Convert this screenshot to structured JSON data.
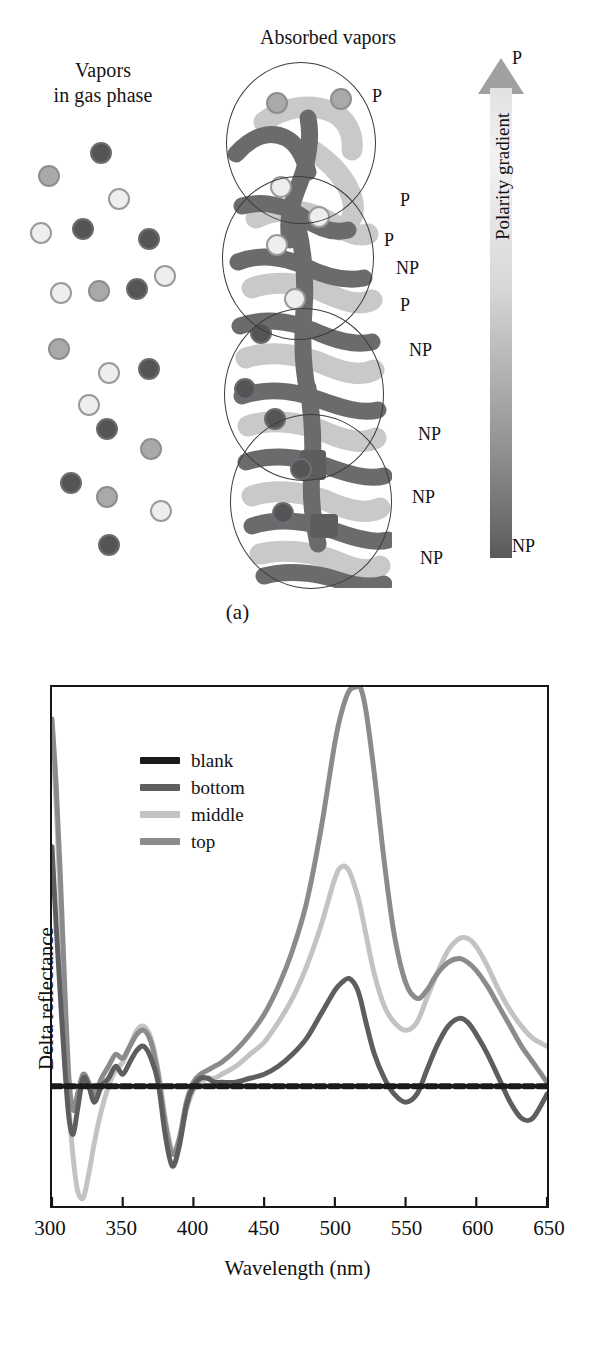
{
  "figure": {
    "panel_a_caption": "(a)",
    "panel_b_caption": "(b)"
  },
  "panel_a": {
    "label_gas_line1": "Vapors",
    "label_gas_line2": "in gas phase",
    "label_absorbed": "Absorbed vapors",
    "gradient": {
      "title": "Polarity gradient",
      "top_label": "P",
      "bottom_label": "NP"
    },
    "polarity_labels": [
      {
        "text": "P",
        "x": 372,
        "y": 86
      },
      {
        "text": "P",
        "x": 400,
        "y": 190
      },
      {
        "text": "P",
        "x": 384,
        "y": 230
      },
      {
        "text": "NP",
        "x": 396,
        "y": 258
      },
      {
        "text": "P",
        "x": 400,
        "y": 295
      },
      {
        "text": "NP",
        "x": 409,
        "y": 340
      },
      {
        "text": "NP",
        "x": 418,
        "y": 424
      },
      {
        "text": "NP",
        "x": 412,
        "y": 487
      },
      {
        "text": "NP",
        "x": 420,
        "y": 548
      }
    ],
    "gas_particles": [
      {
        "x": 60,
        "y": 32,
        "shade": "dark"
      },
      {
        "x": 8,
        "y": 55,
        "shade": "mid"
      },
      {
        "x": 78,
        "y": 78,
        "shade": "light"
      },
      {
        "x": 0,
        "y": 112,
        "shade": "light"
      },
      {
        "x": 42,
        "y": 108,
        "shade": "dark"
      },
      {
        "x": 108,
        "y": 118,
        "shade": "dark"
      },
      {
        "x": 20,
        "y": 172,
        "shade": "light"
      },
      {
        "x": 58,
        "y": 170,
        "shade": "mid"
      },
      {
        "x": 96,
        "y": 168,
        "shade": "dark"
      },
      {
        "x": 124,
        "y": 155,
        "shade": "light"
      },
      {
        "x": 18,
        "y": 228,
        "shade": "mid"
      },
      {
        "x": 68,
        "y": 252,
        "shade": "light"
      },
      {
        "x": 108,
        "y": 248,
        "shade": "dark"
      },
      {
        "x": 48,
        "y": 284,
        "shade": "light"
      },
      {
        "x": 66,
        "y": 308,
        "shade": "dark"
      },
      {
        "x": 110,
        "y": 328,
        "shade": "mid"
      },
      {
        "x": 30,
        "y": 362,
        "shade": "dark"
      },
      {
        "x": 66,
        "y": 376,
        "shade": "mid"
      },
      {
        "x": 120,
        "y": 390,
        "shade": "light"
      },
      {
        "x": 68,
        "y": 424,
        "shade": "dark"
      }
    ],
    "nano_circles": [
      {
        "x": 14,
        "y": 4,
        "size": 150
      },
      {
        "x": 10,
        "y": 118,
        "size": 152
      },
      {
        "x": 12,
        "y": 250,
        "size": 160
      },
      {
        "x": 18,
        "y": 356,
        "size": 162
      }
    ],
    "colors": {
      "particle_dark": "#555558",
      "particle_mid": "#a9a9ab",
      "particle_light": "#eeeeee",
      "nano_dark": "#6b6b6e",
      "nano_light": "#c9c9cb",
      "circle_outline": "#3c3c3c"
    }
  },
  "panel_b": {
    "legend": [
      {
        "label": "blank",
        "color": "#1a1a1a"
      },
      {
        "label": "bottom",
        "color": "#5e5e61"
      },
      {
        "label": "middle",
        "color": "#c3c3c5"
      },
      {
        "label": "top",
        "color": "#8b8b8e"
      }
    ],
    "y_axis_title": "Delta reflectance",
    "x_axis_title": "Wavelength (nm)",
    "x_ticks": [
      "300",
      "350",
      "400",
      "450",
      "500",
      "550",
      "600",
      "650"
    ]
  },
  "chart_data": {
    "type": "line",
    "title": "",
    "xlabel": "Wavelength (nm)",
    "ylabel": "Delta reflectance",
    "xlim": [
      300,
      650
    ],
    "ylim": [
      -0.3,
      1.0
    ],
    "xticks": [
      300,
      350,
      400,
      450,
      500,
      550,
      600,
      650
    ],
    "yticks": [],
    "grid": false,
    "legend_position": "top-left",
    "x": [
      300,
      303,
      306,
      309,
      312,
      315,
      318,
      322,
      326,
      330,
      335,
      340,
      345,
      350,
      355,
      360,
      365,
      370,
      375,
      380,
      385,
      390,
      395,
      400,
      405,
      410,
      415,
      420,
      430,
      440,
      450,
      460,
      470,
      480,
      490,
      500,
      505,
      510,
      515,
      518,
      522,
      528,
      535,
      542,
      550,
      558,
      565,
      572,
      580,
      588,
      594,
      600,
      608,
      616,
      624,
      632,
      640,
      650
    ],
    "series": [
      {
        "name": "blank",
        "color": "#1a1a1a",
        "style": "dashed",
        "values": [
          0,
          0,
          0,
          0,
          0,
          0,
          0,
          0,
          0,
          0,
          0,
          0,
          0,
          0,
          0,
          0,
          0,
          0,
          0,
          0,
          0,
          0,
          0,
          0,
          0,
          0,
          0,
          0,
          0,
          0,
          0,
          0,
          0,
          0,
          0,
          0,
          0,
          0,
          0,
          0,
          0,
          0,
          0,
          0,
          0,
          0,
          0,
          0,
          0,
          0,
          0,
          0,
          0,
          0,
          0,
          0,
          0,
          0
        ]
      },
      {
        "name": "bottom",
        "color": "#5e5e61",
        "style": "solid",
        "values": [
          0.6,
          0.4,
          0.22,
          0.05,
          -0.08,
          -0.12,
          -0.06,
          0.02,
          0.0,
          -0.04,
          0.0,
          0.02,
          0.05,
          0.03,
          0.06,
          0.09,
          0.1,
          0.07,
          0.01,
          -0.12,
          -0.2,
          -0.15,
          -0.05,
          0.0,
          0.02,
          0.02,
          0.01,
          0.01,
          0.01,
          0.02,
          0.03,
          0.05,
          0.08,
          0.12,
          0.18,
          0.24,
          0.26,
          0.27,
          0.25,
          0.22,
          0.16,
          0.08,
          0.02,
          -0.02,
          -0.04,
          -0.02,
          0.04,
          0.1,
          0.15,
          0.17,
          0.16,
          0.13,
          0.08,
          0.02,
          -0.04,
          -0.08,
          -0.08,
          -0.02
        ]
      },
      {
        "name": "middle",
        "color": "#c3c3c5",
        "style": "solid",
        "values": [
          0.88,
          0.7,
          0.45,
          0.18,
          -0.05,
          -0.18,
          -0.26,
          -0.28,
          -0.22,
          -0.14,
          -0.06,
          0.0,
          0.04,
          0.06,
          0.1,
          0.14,
          0.15,
          0.12,
          0.04,
          -0.08,
          -0.16,
          -0.14,
          -0.06,
          -0.01,
          0.01,
          0.02,
          0.02,
          0.03,
          0.05,
          0.08,
          0.11,
          0.16,
          0.22,
          0.3,
          0.4,
          0.52,
          0.55,
          0.54,
          0.49,
          0.45,
          0.38,
          0.28,
          0.2,
          0.16,
          0.14,
          0.16,
          0.22,
          0.28,
          0.34,
          0.37,
          0.37,
          0.35,
          0.3,
          0.24,
          0.19,
          0.15,
          0.12,
          0.1
        ]
      },
      {
        "name": "top",
        "color": "#8b8b8e",
        "style": "solid",
        "values": [
          0.92,
          0.75,
          0.52,
          0.25,
          0.02,
          -0.06,
          -0.02,
          0.03,
          0.01,
          -0.02,
          0.02,
          0.05,
          0.08,
          0.07,
          0.1,
          0.13,
          0.14,
          0.11,
          0.03,
          -0.09,
          -0.17,
          -0.13,
          -0.04,
          0.01,
          0.03,
          0.04,
          0.05,
          0.06,
          0.09,
          0.13,
          0.18,
          0.25,
          0.34,
          0.46,
          0.64,
          0.86,
          0.94,
          0.99,
          1.0,
          1.0,
          0.94,
          0.78,
          0.56,
          0.38,
          0.26,
          0.22,
          0.24,
          0.28,
          0.31,
          0.32,
          0.31,
          0.29,
          0.25,
          0.2,
          0.15,
          0.1,
          0.06,
          0.01
        ]
      }
    ]
  }
}
